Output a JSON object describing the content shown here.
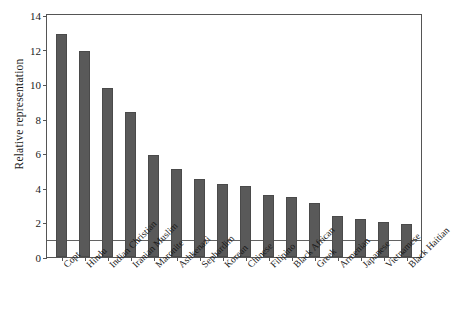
{
  "chart_data": {
    "type": "bar",
    "title": "",
    "subtitle": "",
    "xlabel": "",
    "ylabel": "Relative representation",
    "ylim": [
      0,
      14
    ],
    "yticks": [
      0,
      2,
      4,
      6,
      8,
      10,
      12,
      14
    ],
    "ytick_labels": [
      "0",
      "2",
      "4",
      "6",
      "8",
      "10",
      "12",
      "14"
    ],
    "grid": false,
    "legend": null,
    "bar_color": "#595959",
    "reference_line": {
      "value": 1,
      "label": "",
      "color": "#636363"
    },
    "categories": [
      "Copt",
      "Hindu",
      "Indian Christian",
      "Iranian Muslim",
      "Maronite",
      "Ashkenazi",
      "Sephardim",
      "Korean",
      "Chinese",
      "Filipino",
      "Black African",
      "Greek",
      "Armenian",
      "Japanese",
      "Vietnamese",
      "Black Haitian"
    ],
    "values": [
      12.9,
      11.9,
      9.75,
      8.4,
      5.9,
      5.1,
      4.5,
      4.2,
      4.1,
      3.6,
      3.5,
      3.1,
      2.4,
      2.2,
      2.0,
      1.9
    ]
  }
}
